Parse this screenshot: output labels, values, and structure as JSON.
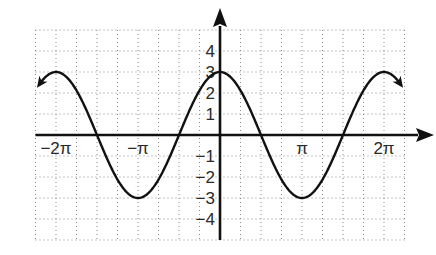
{
  "chart_data": {
    "type": "line",
    "title": "",
    "function": "y = 3cos(x)",
    "xlabel": "",
    "ylabel": "",
    "xlim": [
      -7.0686,
      7.0686
    ],
    "ylim": [
      -5,
      5
    ],
    "grid": true,
    "grid_style": "dotted",
    "x_grid_step": "π/4",
    "y_grid_step": 1,
    "x_ticks": [
      {
        "value": -6.2832,
        "label": "−2π"
      },
      {
        "value": -3.1416,
        "label": "−π"
      },
      {
        "value": 3.1416,
        "label": "π"
      },
      {
        "value": 6.2832,
        "label": "2π"
      }
    ],
    "y_ticks": [
      {
        "value": 4,
        "label": "4"
      },
      {
        "value": 3,
        "label": "3"
      },
      {
        "value": 2,
        "label": "2"
      },
      {
        "value": 1,
        "label": "1"
      },
      {
        "value": -1,
        "label": "−1"
      },
      {
        "value": -2,
        "label": "−2"
      },
      {
        "value": -3,
        "label": "−3"
      },
      {
        "value": -4,
        "label": "−4"
      }
    ],
    "series": [
      {
        "name": "3cos(x)",
        "amplitude": 3,
        "period": "2π",
        "x_range": [
          -6.9,
          6.9
        ],
        "key_points": [
          {
            "x": "−2π",
            "y": 3
          },
          {
            "x": "−3π/2",
            "y": 0
          },
          {
            "x": "−π",
            "y": -3
          },
          {
            "x": "−π/2",
            "y": 0
          },
          {
            "x": "0",
            "y": 3
          },
          {
            "x": "π/2",
            "y": 0
          },
          {
            "x": "π",
            "y": -3
          },
          {
            "x": "3π/2",
            "y": 0
          },
          {
            "x": "2π",
            "y": 3
          }
        ],
        "arrows_at_ends": true
      }
    ],
    "legend": null
  },
  "colors": {
    "curve": "#111111",
    "axes": "#111111",
    "grid": "#8a8a8a",
    "labels": "#2a2a2a"
  }
}
